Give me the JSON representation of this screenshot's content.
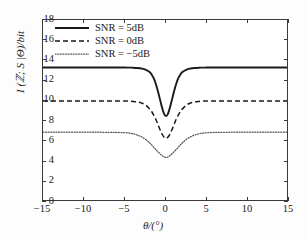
{
  "chart_data": {
    "type": "line",
    "title": "",
    "xlabel": "θ/(°)",
    "ylabel": "I (ℤ; S |Θ)/bit",
    "xlim": [
      -15,
      15
    ],
    "ylim": [
      0,
      18
    ],
    "xticks": [
      -15,
      -10,
      -5,
      0,
      5,
      10,
      15
    ],
    "xtick_labels": [
      "−15",
      "−10",
      "−5",
      "0",
      "5",
      "10",
      "15"
    ],
    "yticks": [
      0,
      2,
      4,
      6,
      8,
      10,
      12,
      14,
      16,
      18
    ],
    "ytick_labels": [
      "0",
      "2",
      "4",
      "6",
      "8",
      "10",
      "12",
      "14",
      "16",
      "18"
    ],
    "grid": false,
    "legend_position": "upper-left",
    "series": [
      {
        "name": "SNR = 5dB",
        "style": "solid",
        "color": "#1a1a1a",
        "plateau": 13.3,
        "minimum": 8.5,
        "dip_center": 0,
        "dip_width": 1.05,
        "x": [
          -15,
          -14,
          -13,
          -12,
          -11,
          -10,
          -9,
          -8,
          -7,
          -6,
          -5,
          -4.5,
          -4,
          -3.5,
          -3,
          -2.5,
          -2,
          -1.75,
          -1.5,
          -1.25,
          -1,
          -0.75,
          -0.5,
          -0.25,
          0,
          0.25,
          0.5,
          0.75,
          1,
          1.25,
          1.5,
          1.75,
          2,
          2.5,
          3,
          3.5,
          4,
          4.5,
          5,
          6,
          7,
          8,
          9,
          10,
          11,
          12,
          13,
          14,
          15
        ],
        "y": [
          13.3,
          13.3,
          13.3,
          13.3,
          13.3,
          13.3,
          13.3,
          13.3,
          13.3,
          13.3,
          13.3,
          13.29,
          13.28,
          13.25,
          13.2,
          13.1,
          12.85,
          12.6,
          12.25,
          11.7,
          11.0,
          10.2,
          9.4,
          8.75,
          8.5,
          8.75,
          9.4,
          10.2,
          11.0,
          11.7,
          12.25,
          12.6,
          12.85,
          13.1,
          13.2,
          13.25,
          13.28,
          13.29,
          13.3,
          13.3,
          13.3,
          13.3,
          13.3,
          13.3,
          13.3,
          13.3,
          13.3,
          13.3,
          13.3
        ]
      },
      {
        "name": "SNR = 0dB",
        "style": "dashed",
        "color": "#1a1a1a",
        "plateau": 10.0,
        "minimum": 6.3,
        "dip_center": 0,
        "dip_width": 1.35,
        "x": [
          -15,
          -14,
          -13,
          -12,
          -11,
          -10,
          -9,
          -8,
          -7,
          -6,
          -5,
          -4.5,
          -4,
          -3.5,
          -3,
          -2.5,
          -2,
          -1.75,
          -1.5,
          -1.25,
          -1,
          -0.75,
          -0.5,
          -0.25,
          0,
          0.25,
          0.5,
          0.75,
          1,
          1.25,
          1.5,
          1.75,
          2,
          2.5,
          3,
          3.5,
          4,
          4.5,
          5,
          6,
          7,
          8,
          9,
          10,
          11,
          12,
          13,
          14,
          15
        ],
        "y": [
          10.0,
          10.0,
          10.0,
          10.0,
          10.0,
          10.0,
          10.0,
          10.0,
          10.0,
          10.0,
          9.99,
          9.98,
          9.95,
          9.9,
          9.8,
          9.6,
          9.2,
          8.95,
          8.6,
          8.2,
          7.7,
          7.2,
          6.75,
          6.42,
          6.3,
          6.42,
          6.75,
          7.2,
          7.7,
          8.2,
          8.6,
          8.95,
          9.2,
          9.6,
          9.8,
          9.9,
          9.95,
          9.98,
          9.99,
          10.0,
          10.0,
          10.0,
          10.0,
          10.0,
          10.0,
          10.0,
          10.0,
          10.0,
          10.0
        ]
      },
      {
        "name": "SNR = −5dB",
        "style": "dotted",
        "color": "#555555",
        "plateau": 6.9,
        "minimum": 4.4,
        "dip_center": 0,
        "dip_width": 1.9,
        "x": [
          -15,
          -14,
          -13,
          -12,
          -11,
          -10,
          -9,
          -8,
          -7,
          -6,
          -5,
          -4.5,
          -4,
          -3.5,
          -3,
          -2.5,
          -2,
          -1.75,
          -1.5,
          -1.25,
          -1,
          -0.75,
          -0.5,
          -0.25,
          0,
          0.25,
          0.5,
          0.75,
          1,
          1.25,
          1.5,
          1.75,
          2,
          2.5,
          3,
          3.5,
          4,
          4.5,
          5,
          6,
          7,
          8,
          9,
          10,
          11,
          12,
          13,
          14,
          15
        ],
        "y": [
          6.9,
          6.9,
          6.9,
          6.9,
          6.9,
          6.9,
          6.9,
          6.9,
          6.89,
          6.88,
          6.85,
          6.82,
          6.75,
          6.62,
          6.45,
          6.2,
          5.85,
          5.65,
          5.42,
          5.2,
          4.98,
          4.78,
          4.6,
          4.46,
          4.4,
          4.46,
          4.6,
          4.78,
          4.98,
          5.2,
          5.42,
          5.65,
          5.85,
          6.2,
          6.45,
          6.62,
          6.75,
          6.82,
          6.85,
          6.88,
          6.89,
          6.9,
          6.9,
          6.9,
          6.9,
          6.9,
          6.9,
          6.9,
          6.9
        ]
      }
    ]
  },
  "legend": {
    "entries": [
      {
        "label": "SNR = 5dB"
      },
      {
        "label": "SNR = 0dB"
      },
      {
        "label": "SNR = −5dB"
      }
    ]
  },
  "colors": {
    "axis": "#3a3a3a",
    "text": "#1a1a1a",
    "series_solid": "#1a1a1a",
    "series_dashed": "#1a1a1a",
    "series_dotted": "#555555",
    "background": "#fdfdfd",
    "plot_background": "#ffffff"
  }
}
